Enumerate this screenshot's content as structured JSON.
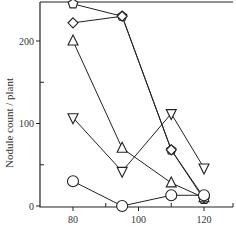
{
  "chart_data": {
    "type": "line",
    "title": "",
    "xlabel": "",
    "ylabel": "Nodule count / plant",
    "xlim": [
      70,
      130
    ],
    "ylim": [
      0,
      250
    ],
    "x_ticks": [
      80,
      100,
      120
    ],
    "x_minor_ticks": [
      90,
      110,
      130
    ],
    "y_ticks": [
      0,
      100,
      200
    ],
    "y_minor_ticks": [
      50,
      150
    ],
    "grid": false,
    "legend": "none",
    "x": [
      80,
      95,
      110,
      120
    ],
    "series": [
      {
        "name": "series-pentagon",
        "marker": "pentagon",
        "values": [
          245,
          230,
          68,
          8
        ]
      },
      {
        "name": "series-diamond",
        "marker": "diamond",
        "values": [
          222,
          230,
          68,
          10
        ]
      },
      {
        "name": "series-triangle-up",
        "marker": "triangle-up",
        "values": [
          200,
          70,
          28,
          10
        ]
      },
      {
        "name": "series-triangle-down",
        "marker": "triangle-down",
        "values": [
          107,
          42,
          112,
          46
        ]
      },
      {
        "name": "series-circle",
        "marker": "circle",
        "values": [
          30,
          0,
          13,
          13
        ]
      }
    ]
  }
}
